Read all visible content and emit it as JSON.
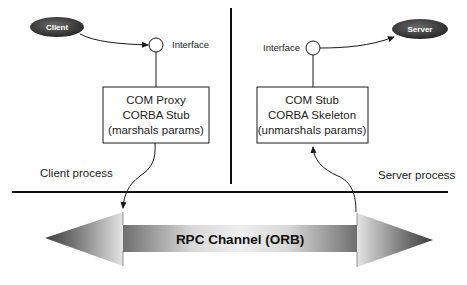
{
  "diagram": {
    "client_node": {
      "label": "Client"
    },
    "server_node": {
      "label": "Server"
    },
    "client_interface": {
      "label": "Interface"
    },
    "server_interface": {
      "label": "Interface"
    },
    "client_box": {
      "lines": [
        "COM Proxy",
        "CORBA Stub",
        "(marshals params)"
      ]
    },
    "server_box": {
      "lines": [
        "COM Stub",
        "CORBA Skeleton",
        "(unmarshals params)"
      ]
    },
    "client_process_label": "Client process",
    "server_process_label": "Server process",
    "channel": {
      "label": "RPC Channel (ORB)"
    },
    "colors": {
      "node_fill": "#3a3a3a",
      "line": "#1a1a1a",
      "arrow_dark": "#4a4a4a",
      "arrow_light": "#d8d8d8"
    }
  }
}
